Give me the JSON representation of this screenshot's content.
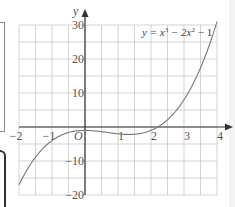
{
  "chart_data": {
    "type": "line",
    "title": "",
    "equation": {
      "prefix": "y = x",
      "exp1": "3",
      "middle": " − 2x",
      "exp2": "2",
      "suffix": " − 1"
    },
    "function": "x^3 - 2x^2 - 1",
    "coefficients": [
      1,
      -2,
      0,
      -1
    ],
    "xlabel": "x",
    "ylabel": "y",
    "origin_label": "O",
    "xlim": [
      -2,
      4
    ],
    "ylim": [
      -20,
      30
    ],
    "x_ticks": [
      {
        "value": -2,
        "label": "−2"
      },
      {
        "value": -1,
        "label": "−1"
      },
      {
        "value": 1,
        "label": "1"
      },
      {
        "value": 2,
        "label": "2"
      },
      {
        "value": 3,
        "label": "3"
      },
      {
        "value": 4,
        "label": "4"
      }
    ],
    "y_ticks": [
      {
        "value": 30,
        "label": "30"
      },
      {
        "value": 20,
        "label": "20"
      },
      {
        "value": 10,
        "label": "10"
      },
      {
        "value": -10,
        "label": "−10"
      },
      {
        "value": -20,
        "label": "−20"
      }
    ],
    "x_grid_step": 0.5,
    "y_grid_step": 5,
    "grid": true,
    "series": [
      {
        "name": "y = x³ − 2x² − 1",
        "x_range": [
          -2,
          4
        ],
        "color": "#777777"
      }
    ]
  }
}
